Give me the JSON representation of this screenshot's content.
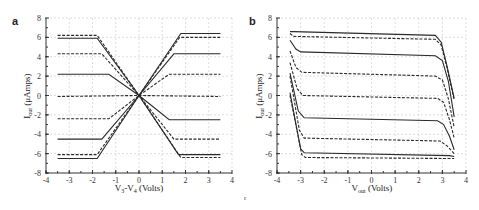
{
  "figure": {
    "footnote": "r"
  },
  "chart_data": [
    {
      "panel": "a",
      "type": "line",
      "title": "",
      "xlabel": "V3-V4 (Volts)",
      "xlabel_main": "V",
      "xlabel_sub1": "3",
      "xlabel_mid": "-V",
      "xlabel_sub2": "4",
      "xlabel_tail": " (Volts)",
      "ylabel": "Iout (μAmps)",
      "ylabel_main": "I",
      "ylabel_sub": "out",
      "ylabel_tail": " (μAmps)",
      "xlim": [
        -4,
        4
      ],
      "ylim": [
        -8,
        8
      ],
      "xticks": [
        -4,
        -3,
        -2,
        -1,
        0,
        1,
        2,
        3,
        4
      ],
      "yticks": [
        -8,
        -6,
        -4,
        -2,
        0,
        2,
        4,
        6,
        8
      ],
      "grid": true,
      "series": [
        {
          "name": "curve1",
          "style": "solid",
          "x": [
            -3.5,
            -1.8,
            0,
            1.8,
            3.5
          ],
          "y": [
            -6.5,
            -6.5,
            0,
            6.4,
            6.4
          ]
        },
        {
          "name": "curve2",
          "style": "dash",
          "x": [
            -3.5,
            -1.8,
            0,
            1.75,
            3.5
          ],
          "y": [
            -6.1,
            -6.1,
            0,
            6.0,
            6.0
          ]
        },
        {
          "name": "curve3",
          "style": "solid",
          "x": [
            -3.5,
            -1.6,
            0,
            1.5,
            3.5
          ],
          "y": [
            -4.5,
            -4.5,
            0,
            4.3,
            4.3
          ]
        },
        {
          "name": "curve4",
          "style": "dash",
          "x": [
            -3.5,
            -1.3,
            0,
            1.3,
            3.5
          ],
          "y": [
            -2.4,
            -2.4,
            0,
            2.2,
            2.2
          ]
        },
        {
          "name": "curve5",
          "style": "dash",
          "x": [
            -3.5,
            0,
            3.5
          ],
          "y": [
            -0.1,
            0,
            -0.1
          ]
        },
        {
          "name": "curve6",
          "style": "solid",
          "x": [
            -3.5,
            -1.3,
            0,
            1.3,
            3.5
          ],
          "y": [
            2.2,
            2.2,
            0,
            -2.5,
            -2.5
          ]
        },
        {
          "name": "curve7",
          "style": "dash",
          "x": [
            -3.5,
            -1.6,
            0,
            1.5,
            3.5
          ],
          "y": [
            4.3,
            4.3,
            0,
            -4.5,
            -4.5
          ]
        },
        {
          "name": "curve8",
          "style": "solid",
          "x": [
            -3.5,
            -1.8,
            0,
            1.7,
            3.5
          ],
          "y": [
            5.9,
            5.9,
            0,
            -6.1,
            -6.1
          ]
        },
        {
          "name": "curve9",
          "style": "dash",
          "x": [
            -3.5,
            -1.8,
            0,
            1.8,
            3.5
          ],
          "y": [
            6.2,
            6.2,
            0,
            -6.4,
            -6.4
          ]
        }
      ]
    },
    {
      "panel": "b",
      "type": "line",
      "title": "",
      "xlabel": "Vout (Volts)",
      "xlabel_main": "V",
      "xlabel_sub1": "out",
      "xlabel_tail": " (Volts)",
      "ylabel": "Iout (μAmps)",
      "ylabel_main": "I",
      "ylabel_sub": "out",
      "ylabel_tail": " (μAmps)",
      "xlim": [
        -4,
        4
      ],
      "ylim": [
        -8,
        8
      ],
      "xticks": [
        -4,
        -3,
        -2,
        -1,
        0,
        1,
        2,
        3,
        4
      ],
      "yticks": [
        -8,
        -6,
        -4,
        -2,
        0,
        2,
        4,
        6,
        8
      ],
      "grid": true,
      "series": [
        {
          "name": "curve1",
          "style": "solid",
          "x": [
            -3.45,
            -3.3,
            2.7,
            2.95,
            3.2,
            3.5
          ],
          "y": [
            6.6,
            6.6,
            6.2,
            5.5,
            3.0,
            -0.3
          ]
        },
        {
          "name": "curve2",
          "style": "dash",
          "x": [
            -3.45,
            -3.3,
            2.7,
            2.95,
            3.2,
            3.5
          ],
          "y": [
            6.4,
            6.1,
            5.8,
            5.2,
            2.8,
            -0.5
          ]
        },
        {
          "name": "curve3",
          "style": "solid",
          "x": [
            -3.45,
            -3.2,
            -3.0,
            2.7,
            3.0,
            3.25,
            3.5
          ],
          "y": [
            5.7,
            4.8,
            4.5,
            4.1,
            3.6,
            1.5,
            -2.2
          ]
        },
        {
          "name": "curve4",
          "style": "dash",
          "x": [
            -3.45,
            -3.2,
            -2.95,
            2.7,
            3.0,
            3.25,
            3.5
          ],
          "y": [
            4.6,
            2.9,
            2.4,
            2.0,
            1.6,
            -0.3,
            -3.3
          ]
        },
        {
          "name": "curve5",
          "style": "dash",
          "x": [
            -3.45,
            -3.15,
            -2.9,
            2.8,
            3.05,
            3.3,
            3.5
          ],
          "y": [
            3.4,
            0.7,
            0.0,
            -0.3,
            -0.7,
            -2.5,
            -4.4
          ]
        },
        {
          "name": "curve6",
          "style": "solid",
          "x": [
            -3.45,
            -3.1,
            -2.85,
            2.8,
            3.05,
            3.3,
            3.5
          ],
          "y": [
            2.3,
            -1.6,
            -2.3,
            -2.6,
            -3.0,
            -4.2,
            -5.6
          ]
        },
        {
          "name": "curve7",
          "style": "dash",
          "x": [
            -3.45,
            -3.05,
            -2.85,
            2.9,
            3.2,
            3.5
          ],
          "y": [
            2.0,
            -3.6,
            -4.4,
            -4.7,
            -5.2,
            -6.0
          ]
        },
        {
          "name": "curve8",
          "style": "solid",
          "x": [
            -3.45,
            -3.0,
            -2.85,
            3.3,
            3.5
          ],
          "y": [
            0.3,
            -5.5,
            -5.9,
            -6.2,
            -6.3
          ]
        },
        {
          "name": "curve9",
          "style": "dash",
          "x": [
            -3.45,
            -2.95,
            -2.8,
            3.3,
            3.5
          ],
          "y": [
            0.0,
            -6.1,
            -6.4,
            -6.5,
            -6.5
          ]
        }
      ]
    }
  ]
}
